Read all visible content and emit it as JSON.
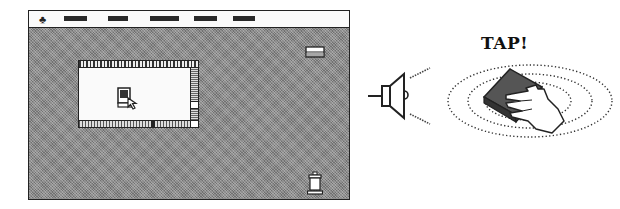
{
  "desktop": {
    "menubar": {
      "apple_glyph": "",
      "menu_items": [
        {
          "name": "menu-1",
          "left": 35,
          "width": 23
        },
        {
          "name": "menu-2",
          "left": 79,
          "width": 20
        },
        {
          "name": "menu-3",
          "left": 121,
          "width": 29
        },
        {
          "name": "menu-4",
          "left": 165,
          "width": 23
        },
        {
          "name": "menu-5",
          "left": 204,
          "width": 22
        }
      ]
    },
    "icons": {
      "disk": "disk-icon",
      "trash": "trash-icon",
      "window_icon": "computer-with-pointer-icon"
    }
  },
  "illustration": {
    "speaker": "speaker-icon",
    "tap_text": "TAP!",
    "tap_target": "hand-tapping-device-icon"
  },
  "colors": {
    "desktop_gray": "#8a8a8a",
    "ink": "#222222",
    "paper": "#fafafa"
  }
}
